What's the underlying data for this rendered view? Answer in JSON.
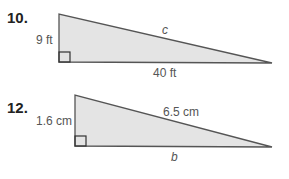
{
  "problems": [
    {
      "number": "10.",
      "leg_vertical": "9 ft",
      "leg_horizontal": "40 ft",
      "hypotenuse": "c"
    },
    {
      "number": "12.",
      "leg_vertical": "1.6 cm",
      "leg_horizontal": "b",
      "hypotenuse": "6.5 cm"
    }
  ],
  "colors": {
    "fill": "#e4e4e4",
    "stroke": "#555555"
  }
}
